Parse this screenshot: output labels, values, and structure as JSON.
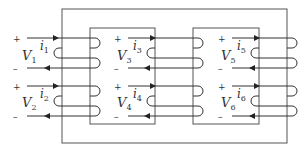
{
  "diagram": {
    "type": "three-winding-pair magnetic core",
    "windings": [
      {
        "id": "w1",
        "voltage": "V",
        "voltage_sub": "1",
        "current": "i",
        "current_sub": "1",
        "plus": "+",
        "minus": "–"
      },
      {
        "id": "w2",
        "voltage": "V",
        "voltage_sub": "2",
        "current": "i",
        "current_sub": "2",
        "plus": "+",
        "minus": "–"
      },
      {
        "id": "w3",
        "voltage": "V",
        "voltage_sub": "3",
        "current": "i",
        "current_sub": "3",
        "plus": "+",
        "minus": "–"
      },
      {
        "id": "w4",
        "voltage": "V",
        "voltage_sub": "4",
        "current": "i",
        "current_sub": "4",
        "plus": "+",
        "minus": "–"
      },
      {
        "id": "w5",
        "voltage": "V",
        "voltage_sub": "5",
        "current": "i",
        "current_sub": "5",
        "plus": "+",
        "minus": "–"
      },
      {
        "id": "w6",
        "voltage": "V",
        "voltage_sub": "6",
        "current": "i",
        "current_sub": "6",
        "plus": "+",
        "minus": "–"
      }
    ],
    "colors": {
      "core": "#555555",
      "wire": "#333333",
      "background": "#ffffff"
    }
  }
}
